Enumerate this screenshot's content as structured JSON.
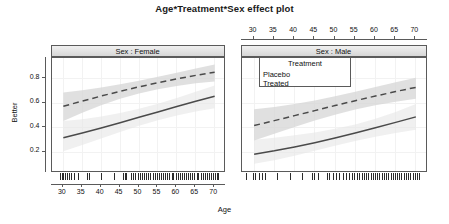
{
  "title": "Age*Treatment*Sex effect plot",
  "axes": {
    "xlabel": "Age",
    "ylabel": "Better",
    "x_ticks": [
      30,
      35,
      40,
      45,
      50,
      55,
      60,
      65,
      70
    ],
    "x_tick_labels": [
      "30",
      "35",
      "40",
      "45",
      "50",
      "55",
      "60",
      "65",
      "70"
    ],
    "y_ticks": [
      0.2,
      0.4,
      0.6,
      0.8
    ],
    "y_tick_labels": [
      "0.2",
      "0.4",
      "0.6",
      "0.8"
    ],
    "xlim": [
      27,
      73
    ],
    "ylim": [
      0.03,
      0.97
    ]
  },
  "legend": {
    "title": "Treatment",
    "items": [
      {
        "label": "Placebo",
        "style": "solid"
      },
      {
        "label": "Treated",
        "style": "dashed"
      }
    ]
  },
  "panels": [
    {
      "strip": "Sex : Female",
      "x_axis_side": "bottom"
    },
    {
      "strip": "Sex : Male",
      "x_axis_side": "top"
    }
  ],
  "colors": {
    "line": "#4a4a4a",
    "band": "#d4d4d4",
    "band_light": "#e6e6e6",
    "frame": "#5a5a5a",
    "strip_bg": "#e2e2e2",
    "grid": "#f2f2f2",
    "rug": "#2b2b2b"
  },
  "chart_data": {
    "type": "line",
    "title": "Age*Treatment*Sex effect plot",
    "xlabel": "Age",
    "ylabel": "Better",
    "xlim": [
      27,
      73
    ],
    "ylim": [
      0.03,
      0.97
    ],
    "grid": true,
    "legend_position": "inside-top-left-of-right-panel",
    "facets": [
      "Sex : Female",
      "Sex : Male"
    ],
    "x": [
      30,
      35,
      40,
      45,
      50,
      55,
      60,
      65,
      70
    ],
    "panels": [
      {
        "facet": "Sex : Female",
        "series": [
          {
            "name": "Treated",
            "style": "dashed",
            "values": [
              0.575,
              0.618,
              0.659,
              0.698,
              0.734,
              0.768,
              0.799,
              0.828,
              0.854
            ],
            "ci_lower": [
              0.455,
              0.522,
              0.583,
              0.636,
              0.679,
              0.714,
              0.742,
              0.763,
              0.778
            ],
            "ci_upper": [
              0.689,
              0.706,
              0.729,
              0.755,
              0.784,
              0.816,
              0.85,
              0.884,
              0.916
            ]
          },
          {
            "name": "Placebo",
            "style": "solid",
            "values": [
              0.318,
              0.357,
              0.398,
              0.441,
              0.485,
              0.529,
              0.573,
              0.616,
              0.658
            ],
            "ci_lower": [
              0.208,
              0.259,
              0.312,
              0.366,
              0.417,
              0.462,
              0.5,
              0.532,
              0.559
            ],
            "ci_upper": [
              0.455,
              0.47,
              0.492,
              0.521,
              0.556,
              0.597,
              0.643,
              0.694,
              0.745
            ]
          }
        ],
        "rug": [
          29.6,
          30.1,
          30.4,
          30.9,
          31.3,
          31.8,
          32.4,
          33.1,
          34.2,
          36.6,
          37.1,
          40.4,
          43.9,
          46.1,
          46.6,
          47.0,
          48.3,
          48.9,
          49.4,
          50.1,
          50.6,
          51.2,
          51.8,
          52.3,
          52.9,
          53.4,
          54.0,
          54.6,
          55.1,
          55.7,
          56.2,
          56.8,
          57.3,
          57.9,
          58.4,
          59.0,
          59.5,
          60.1,
          60.6,
          61.2,
          61.7,
          62.3,
          62.8,
          63.4,
          63.9,
          64.5,
          65.0,
          65.6,
          66.1,
          66.7,
          67.2,
          67.8,
          68.3,
          68.9,
          69.4,
          70.0,
          70.5,
          71.0,
          71.4
        ]
      },
      {
        "facet": "Sex : Male",
        "series": [
          {
            "name": "Treated",
            "style": "dashed",
            "values": [
              0.418,
              0.458,
              0.499,
              0.54,
              0.581,
              0.621,
              0.659,
              0.696,
              0.73
            ],
            "ci_lower": [
              0.296,
              0.351,
              0.406,
              0.459,
              0.507,
              0.549,
              0.584,
              0.613,
              0.637
            ],
            "ci_upper": [
              0.552,
              0.569,
              0.593,
              0.623,
              0.657,
              0.694,
              0.732,
              0.771,
              0.809
            ]
          },
          {
            "name": "Placebo",
            "style": "solid",
            "values": [
              0.183,
              0.211,
              0.243,
              0.278,
              0.316,
              0.357,
              0.4,
              0.444,
              0.489
            ],
            "ci_lower": [
              0.105,
              0.135,
              0.171,
              0.211,
              0.252,
              0.291,
              0.326,
              0.357,
              0.384
            ],
            "ci_upper": [
              0.302,
              0.319,
              0.339,
              0.362,
              0.391,
              0.427,
              0.473,
              0.529,
              0.594
            ]
          }
        ],
        "rug": [
          28.4,
          30.2,
          30.7,
          31.5,
          32.2,
          33.0,
          36.1,
          39.2,
          42.1,
          44.6,
          45.2,
          46.1,
          48.4,
          49.0,
          49.9,
          50.7,
          51.4,
          52.3,
          53.1,
          53.8,
          54.6,
          55.1,
          55.9,
          56.4,
          57.0,
          57.6,
          58.1,
          58.6,
          59.2,
          59.7,
          60.2,
          60.8,
          61.3,
          61.9,
          62.4,
          63.0,
          63.5,
          64.1,
          64.6,
          65.2,
          65.7,
          66.3,
          66.8,
          67.4,
          67.9,
          68.5,
          69.0,
          69.6,
          70.1,
          70.7,
          71.2
        ]
      }
    ]
  }
}
